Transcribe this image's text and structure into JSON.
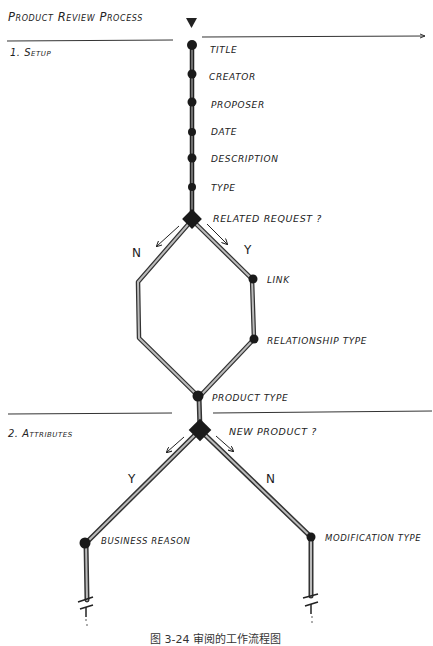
{
  "title": "Product Review Process",
  "sections": [
    {
      "label": "1. Setup"
    },
    {
      "label": "2. Attributes"
    }
  ],
  "setup_nodes": [
    {
      "label": "Title"
    },
    {
      "label": "Creator"
    },
    {
      "label": "Proposer"
    },
    {
      "label": "Date"
    },
    {
      "label": "Description"
    },
    {
      "label": "Type"
    }
  ],
  "decisions": [
    {
      "label": "Related Request ?",
      "yes_label": "Y",
      "no_label": "N"
    },
    {
      "label": "New Product ?",
      "yes_label": "Y",
      "no_label": "N"
    }
  ],
  "related_yes_nodes": [
    {
      "label": "Link"
    },
    {
      "label": "Relationship Type"
    }
  ],
  "merge_node": {
    "label": "Product Type"
  },
  "attribute_nodes": [
    {
      "label": "Business Reason"
    },
    {
      "label": "Modification Type"
    }
  ],
  "caption": "图 3-24  审阅的工作流程图",
  "colors": {
    "ink": "#1a1a1a",
    "line_fill": "#9a9a9a",
    "paper": "#ffffff"
  }
}
